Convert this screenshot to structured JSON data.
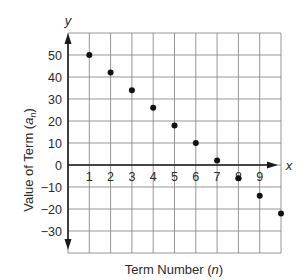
{
  "chart_data": {
    "type": "scatter",
    "title": "",
    "xlabel": "Term Number",
    "xlabel_var": "n",
    "ylabel": "Value of Term",
    "ylabel_var": "a",
    "ylabel_sub": "n",
    "x_axis_letter": "x",
    "y_axis_letter": "y",
    "x": [
      1,
      2,
      3,
      4,
      5,
      6,
      7,
      8,
      9,
      10
    ],
    "values": [
      50,
      42,
      34,
      26,
      18,
      10,
      2,
      -6,
      -14,
      -22
    ],
    "xlim": [
      0,
      10
    ],
    "ylim": [
      -40,
      60
    ],
    "x_ticks": [
      1,
      2,
      3,
      4,
      5,
      6,
      7,
      8,
      9
    ],
    "y_ticks": [
      50,
      40,
      30,
      20,
      10,
      0,
      -10,
      -20,
      -30
    ],
    "y_tick_labels": [
      "50",
      "40",
      "30",
      "20",
      "10",
      "0",
      "−10",
      "−20",
      "−30"
    ],
    "grid": true,
    "legend": null,
    "colors": {
      "grid": "#8a8a8a",
      "axis": "#1a1a1a",
      "point": "#111111"
    }
  }
}
